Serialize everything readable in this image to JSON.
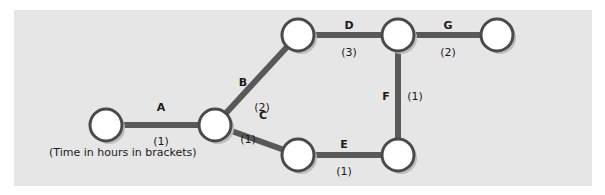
{
  "diagram": {
    "note": "(Time in hours in brackets)",
    "colors": {
      "background": "#e6e6e6",
      "edge": "#595959",
      "node_fill": "#ffffff",
      "node_stroke": "#4a4a4a"
    },
    "nodes": [
      {
        "id": "n1",
        "x": 106,
        "y": 125
      },
      {
        "id": "n2",
        "x": 215,
        "y": 125
      },
      {
        "id": "n3",
        "x": 298,
        "y": 35
      },
      {
        "id": "n4",
        "x": 398,
        "y": 35
      },
      {
        "id": "n5",
        "x": 497,
        "y": 35
      },
      {
        "id": "n6",
        "x": 298,
        "y": 155
      },
      {
        "id": "n7",
        "x": 398,
        "y": 155
      }
    ],
    "edges": [
      {
        "label": "A",
        "duration": "(1)",
        "from": "n1",
        "to": "n2"
      },
      {
        "label": "B",
        "duration": "(2)",
        "from": "n2",
        "to": "n3"
      },
      {
        "label": "C",
        "duration": "(1)",
        "from": "n2",
        "to": "n6"
      },
      {
        "label": "D",
        "duration": "(3)",
        "from": "n3",
        "to": "n4"
      },
      {
        "label": "E",
        "duration": "(1)",
        "from": "n6",
        "to": "n7"
      },
      {
        "label": "F",
        "duration": "(1)",
        "from": "n7",
        "to": "n4"
      },
      {
        "label": "G",
        "duration": "(2)",
        "from": "n4",
        "to": "n5"
      }
    ]
  }
}
